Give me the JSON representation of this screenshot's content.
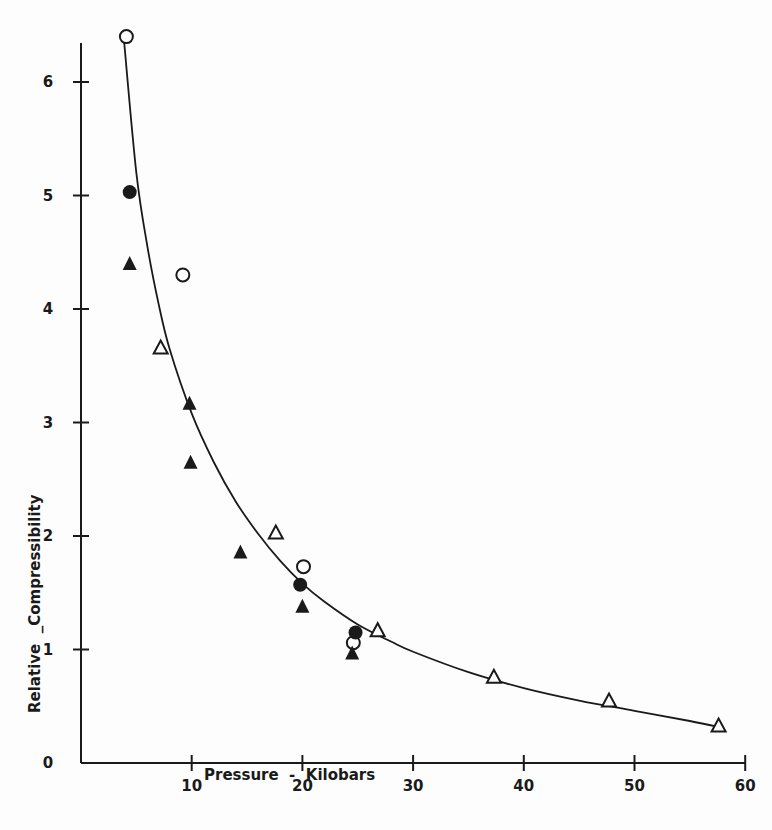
{
  "chart_data": {
    "type": "scatter",
    "title": "",
    "xlabel": "Pressure  -  Kilobars",
    "ylabel": "Relative  _Compressibility",
    "xlim": [
      0,
      60
    ],
    "ylim": [
      0,
      6.5
    ],
    "x_ticks": [
      10,
      20,
      30,
      40,
      50,
      60
    ],
    "x_tick_labels": [
      "10",
      "20",
      "30",
      "40",
      "50",
      "60"
    ],
    "y_ticks": [
      0,
      1,
      2,
      3,
      4,
      5,
      6
    ],
    "y_tick_labels": [
      "0",
      "1",
      "2",
      "3",
      "4",
      "5",
      "6"
    ],
    "grid": false,
    "legend": null,
    "series": [
      {
        "name": "open circles",
        "marker": "open-circle",
        "points": [
          [
            4.1,
            6.4
          ],
          [
            9.2,
            4.3
          ],
          [
            20.1,
            1.73
          ],
          [
            24.6,
            1.06
          ]
        ]
      },
      {
        "name": "filled circles",
        "marker": "filled-circle",
        "points": [
          [
            4.4,
            5.03
          ],
          [
            19.8,
            1.57
          ],
          [
            24.8,
            1.15
          ]
        ]
      },
      {
        "name": "filled triangles",
        "marker": "filled-triangle",
        "points": [
          [
            4.4,
            4.4
          ],
          [
            9.8,
            3.17
          ],
          [
            9.9,
            2.65
          ],
          [
            14.4,
            1.86
          ],
          [
            20.0,
            1.38
          ],
          [
            24.5,
            0.97
          ]
        ]
      },
      {
        "name": "open triangles",
        "marker": "open-triangle",
        "points": [
          [
            7.2,
            3.66
          ],
          [
            17.6,
            2.03
          ],
          [
            26.8,
            1.17
          ],
          [
            37.3,
            0.76
          ],
          [
            47.7,
            0.55
          ],
          [
            57.6,
            0.33
          ]
        ]
      }
    ],
    "fit_curve": {
      "name": "smooth fit",
      "points": [
        [
          3.9,
          6.35
        ],
        [
          5,
          5.2
        ],
        [
          6,
          4.55
        ],
        [
          7,
          4.05
        ],
        [
          8,
          3.65
        ],
        [
          10,
          3.08
        ],
        [
          12,
          2.65
        ],
        [
          14,
          2.3
        ],
        [
          16,
          2.02
        ],
        [
          18,
          1.78
        ],
        [
          20,
          1.58
        ],
        [
          22,
          1.42
        ],
        [
          25,
          1.22
        ],
        [
          28,
          1.07
        ],
        [
          30,
          0.98
        ],
        [
          35,
          0.8
        ],
        [
          40,
          0.66
        ],
        [
          45,
          0.55
        ],
        [
          50,
          0.46
        ],
        [
          55,
          0.37
        ],
        [
          58,
          0.31
        ]
      ]
    }
  }
}
